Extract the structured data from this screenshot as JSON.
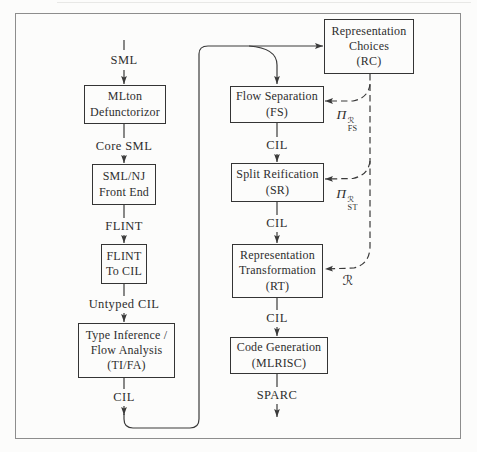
{
  "figure": {
    "type": "compiler-pipeline-flow-diagram",
    "boxes": {
      "mlton": {
        "l1": "MLton",
        "l2": "Defunctorizor"
      },
      "smlnj": {
        "l1": "SML/NJ",
        "l2": "Front End"
      },
      "flint2cil": {
        "l1": "FLINT",
        "l2": "To CIL"
      },
      "tifa": {
        "l1": "Type Inference /",
        "l2": "Flow Analysis",
        "l3": "(TI/FA)"
      },
      "fs": {
        "l1": "Flow Separation",
        "l2": "(FS)"
      },
      "sr": {
        "l1": "Split Reification",
        "l2": "(SR)"
      },
      "rt": {
        "l1": "Representation",
        "l2": "Transformation",
        "l3": "(RT)"
      },
      "codegen": {
        "l1": "Code Generation",
        "l2": "(MLRISC)"
      },
      "rc": {
        "l1": "Representation",
        "l2": "Choices",
        "l3": "(RC)"
      }
    },
    "edge_labels": {
      "sml": "SML",
      "core_sml": "Core SML",
      "flint": "FLINT",
      "untyped_cil": "Untyped CIL",
      "cil": "CIL",
      "sparc": "SPARC"
    },
    "dashed_labels": {
      "pi_fs": {
        "base": "Π",
        "sup": "ℛ",
        "sub": "FS"
      },
      "pi_st": {
        "base": "Π",
        "sup": "ℛ",
        "sub": "ST"
      },
      "r": {
        "symbol": "ℛ"
      }
    },
    "colors": {
      "paper": "#fcfcfb",
      "ink": "#2e2e2e",
      "line": "#3a3a3a",
      "frame": "#8d8d8d"
    }
  }
}
